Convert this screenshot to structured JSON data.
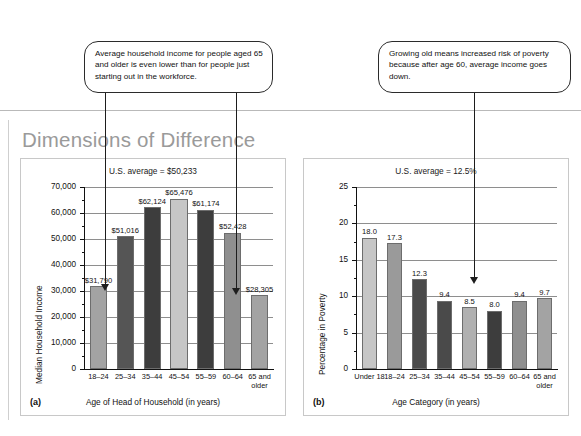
{
  "page": {
    "title": "Dimensions of Difference"
  },
  "callouts": [
    {
      "id": "callout-a",
      "text": "Average household income for people aged 65 and older is even lower than for people just starting out in the workforce."
    },
    {
      "id": "callout-b",
      "text": "Growing old means increased risk of poverty because after age 60, average income goes down."
    }
  ],
  "panels": [
    {
      "letter": "(a)"
    },
    {
      "letter": "(b)"
    }
  ],
  "chart_data": [
    {
      "type": "bar",
      "title": "U.S. average = $50,233",
      "xlabel": "Age of Head of Household (in years)",
      "ylabel": "Median Household Income",
      "ylim": [
        0,
        70000
      ],
      "yticks": [
        "0",
        "10,000",
        "20,000",
        "30,000",
        "40,000",
        "50,000",
        "60,000",
        "70,000"
      ],
      "ytick_values": [
        0,
        10000,
        20000,
        30000,
        40000,
        50000,
        60000,
        70000
      ],
      "grid": true,
      "legend": "none",
      "categories": [
        "18–24",
        "25–34",
        "35–44",
        "45–54",
        "55–59",
        "60–64",
        "65 and older"
      ],
      "values": [
        31790,
        51016,
        62124,
        65476,
        61174,
        52428,
        28305
      ],
      "data_labels": [
        "$31,790",
        "$51,016",
        "$62,124",
        "$65,476",
        "$61,174",
        "$52,428",
        "$28,305"
      ],
      "bar_colors": [
        "#a3a3a3",
        "#555555",
        "#3d3d3d",
        "#c6c6c6",
        "#3d3d3d",
        "#8f8f8f",
        "#a3a3a3"
      ],
      "annotation_targets": [
        0,
        6
      ]
    },
    {
      "type": "bar",
      "title": "U.S. average = 12.5%",
      "xlabel": "Age Category (in years)",
      "ylabel": "Percentage in Poverty",
      "ylim": [
        0,
        25
      ],
      "yticks": [
        "0",
        "5",
        "10",
        "15",
        "20",
        "25"
      ],
      "ytick_values": [
        0,
        5,
        10,
        15,
        20,
        25
      ],
      "grid": true,
      "legend": "none",
      "categories": [
        "Under 18",
        "18–24",
        "25–34",
        "35–44",
        "45–54",
        "55–59",
        "60–64",
        "65 and older"
      ],
      "values": [
        18.0,
        17.3,
        12.3,
        9.4,
        8.5,
        8.0,
        9.4,
        9.7
      ],
      "data_labels": [
        "18.0",
        "17.3",
        "12.3",
        "9.4",
        "8.5",
        "8.0",
        "9.4",
        "9.7"
      ],
      "bar_colors": [
        "#c6c6c6",
        "#9a9a9a",
        "#4a4a4a",
        "#4a4a4a",
        "#b0b0b0",
        "#3d3d3d",
        "#8f8f8f",
        "#a3a3a3"
      ],
      "annotation_targets": [
        6
      ]
    }
  ]
}
